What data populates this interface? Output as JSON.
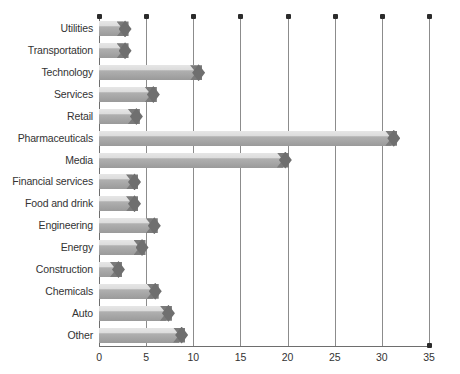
{
  "chart_data": {
    "type": "bar",
    "orientation": "horizontal",
    "title": "",
    "subtitle": "",
    "xlabel": "",
    "ylabel": "",
    "xlim": [
      0,
      35
    ],
    "ylim": null,
    "grid": true,
    "gridlines_axis": "x",
    "legend": null,
    "legend_position": "none",
    "x_ticks": [
      0,
      5,
      10,
      15,
      20,
      25,
      30,
      35
    ],
    "x_tick_labels": [
      "0",
      "5",
      "10",
      "15",
      "20",
      "25",
      "30",
      "35"
    ],
    "categories": [
      "Utilities",
      "Transportation",
      "Technology",
      "Services",
      "Retail",
      "Pharmaceuticals",
      "Media",
      "Financial services",
      "Food and drink",
      "Engineering",
      "Energy",
      "Construction",
      "Chemicals",
      "Auto",
      "Other"
    ],
    "values": [
      2.5,
      2.5,
      10.3,
      5.5,
      3.7,
      31.0,
      19.5,
      3.5,
      3.5,
      5.6,
      4.3,
      1.8,
      5.7,
      7.1,
      8.5
    ],
    "series": [
      {
        "name": "",
        "values": [
          2.5,
          2.5,
          10.3,
          5.5,
          3.7,
          31.0,
          19.5,
          3.5,
          3.5,
          5.6,
          4.3,
          1.8,
          5.7,
          7.1,
          8.5
        ]
      }
    ],
    "colors": {
      "bar_light": "#dcdcdc",
      "bar_dark": "#a2a2a2",
      "bar_cap": "#6f6f6f",
      "gridline": "#8c8c8c",
      "axis": "#6e6e6e",
      "text": "#333333",
      "dot": "#2b2b2b",
      "background": "#ffffff"
    }
  }
}
